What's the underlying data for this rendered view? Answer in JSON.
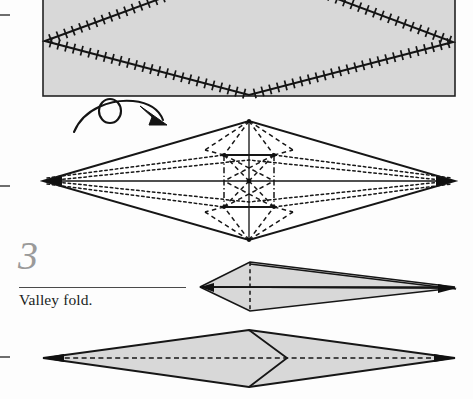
{
  "page": {
    "width": 473,
    "height": 399,
    "background": "#fdfdfd",
    "paper_fill": "#d8d8d8",
    "line_color": "#1a1a1a",
    "step_number_color": "#9a9a9a"
  },
  "step": {
    "number": "3",
    "caption": "Valley fold.",
    "rule_present": true
  },
  "crop_marks": [
    {
      "name": "crop-mark-top",
      "x": 0,
      "y": 15,
      "length": 10
    },
    {
      "name": "crop-mark-middle",
      "x": 0,
      "y": 186,
      "length": 10
    },
    {
      "name": "crop-mark-bottom",
      "x": 0,
      "y": 357,
      "length": 10
    }
  ],
  "figures": [
    {
      "id": "figure-1",
      "name": "crimped-rectangle-with-serrated-diamond",
      "description": "Gray rectangular sheet with a large serrated (crimped) diamond crease running corner to corner",
      "shape": "rectangle",
      "rect": {
        "x": 43,
        "y": -40,
        "width": 412,
        "height": 136
      },
      "diamond": {
        "left": {
          "x": 45,
          "y": 41
        },
        "right": {
          "x": 453,
          "y": 42
        },
        "top": {
          "x": 249,
          "y": -34
        },
        "bottom": {
          "x": 249,
          "y": 95
        }
      },
      "serration_marks": true,
      "fill": "#d8d8d8"
    },
    {
      "id": "turn-over-arrow",
      "name": "turn-over-arrow",
      "description": "Looping turn-over / flip-the-model arrow",
      "x": 70,
      "y": 100,
      "width": 100,
      "height": 32
    },
    {
      "id": "figure-2",
      "name": "crease-pattern-diamond",
      "description": "Wide white diamond showing full crease pattern: solid edges, dotted valley folds, dashed and dash-dot mountain creases converging on the center",
      "shape": "diamond",
      "left": {
        "x": 43,
        "y": 181
      },
      "right": {
        "x": 455,
        "y": 181
      },
      "top": {
        "x": 249,
        "y": 121
      },
      "bottom": {
        "x": 249,
        "y": 240
      },
      "fill": "#ffffff"
    },
    {
      "id": "figure-3",
      "name": "narrow-dart-partial-fold",
      "description": "Narrow gray dart/kite shape after folding, with a dashed vertical crease near the blunt end",
      "shape": "dart",
      "tip_left": {
        "x": 200,
        "y": 287
      },
      "tip_right": {
        "x": 455,
        "y": 288
      },
      "apex_top": {
        "x": 250,
        "y": 262
      },
      "apex_bottom": {
        "x": 250,
        "y": 311
      },
      "dashed_crease": true,
      "fill": "#d8d8d8"
    },
    {
      "id": "figure-4",
      "name": "result-diamond-with-valley-crease",
      "description": "Final wide gray diamond with a horizontal dashed valley-fold line and a V-shaped notch flap at the center",
      "shape": "diamond",
      "left": {
        "x": 43,
        "y": 358
      },
      "right": {
        "x": 455,
        "y": 358
      },
      "top": {
        "x": 249,
        "y": 330
      },
      "bottom": {
        "x": 249,
        "y": 387
      },
      "valley_line_dashed": true,
      "notch": {
        "point": {
          "x": 286,
          "y": 358
        },
        "direction": "right"
      },
      "fill": "#d8d8d8"
    }
  ]
}
